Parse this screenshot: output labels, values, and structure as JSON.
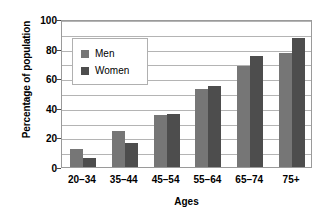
{
  "chart_data": {
    "type": "bar",
    "title": "",
    "xlabel": "Ages",
    "ylabel": "Percentage of population",
    "categories": [
      "20–34",
      "35–44",
      "45–54",
      "55–64",
      "65–74",
      "75+"
    ],
    "series": [
      {
        "name": "Men",
        "values": [
          12,
          24,
          35,
          53,
          68,
          77
        ],
        "color": "#767676"
      },
      {
        "name": "Women",
        "values": [
          6,
          16,
          36,
          55,
          75,
          87
        ],
        "color": "#4d4d4d"
      }
    ],
    "ylim": [
      0,
      100
    ],
    "ytick_labels": [
      "0",
      "20",
      "40",
      "60",
      "80",
      "100"
    ],
    "ytick_values": [
      0,
      20,
      40,
      60,
      80,
      100
    ],
    "gridline_values": [
      10,
      20,
      30,
      40,
      50,
      60,
      70,
      80,
      90,
      100
    ],
    "grid": true,
    "legend_position": "upper left",
    "legend_entries": [
      "Men",
      "Women"
    ]
  },
  "legend": {
    "men_label": "Men",
    "women_label": "Women"
  },
  "axes": {
    "y_title": "Percentage of population",
    "x_title": "Ages"
  }
}
